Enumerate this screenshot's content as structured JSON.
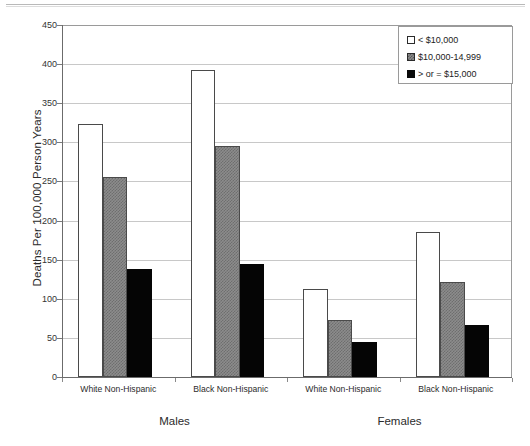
{
  "chart_data": {
    "type": "bar",
    "title": "",
    "xlabel": "",
    "ylabel": "Deaths Per 100,000 Person Years",
    "ylim": [
      0,
      450
    ],
    "yticks": [
      0,
      50,
      100,
      150,
      200,
      250,
      300,
      350,
      400,
      450
    ],
    "ytick_labels": [
      "0",
      "50",
      "100",
      "150",
      "200",
      "250",
      "300",
      "350",
      "400",
      "450"
    ],
    "grid": true,
    "legend_position": "top-right",
    "categories": [
      "White Non-Hispanic",
      "Black Non-Hispanic",
      "White Non-Hispanic",
      "Black Non-Hispanic"
    ],
    "group_labels": [
      "Males",
      "Females"
    ],
    "series": [
      {
        "name": "< $10,000",
        "values": [
          324,
          392,
          113,
          186
        ],
        "color": "#ffffff"
      },
      {
        "name": "$10,000-14,999",
        "values": [
          256,
          295,
          73,
          121
        ],
        "color": "#8c8c8c"
      },
      {
        "name": "> or = $15,000",
        "values": [
          138,
          144,
          45,
          66
        ],
        "color": "#0a0a0a"
      }
    ]
  },
  "legend": {
    "items": [
      {
        "label": "< $10,000",
        "swatch": "white-square-icon"
      },
      {
        "label": "$10,000-14,999",
        "swatch": "gray-hatched-square-icon"
      },
      {
        "label": "> or = $15,000",
        "swatch": "black-square-icon"
      }
    ]
  },
  "axis": {
    "y_title": "Deaths Per 100,000 Person Years"
  }
}
